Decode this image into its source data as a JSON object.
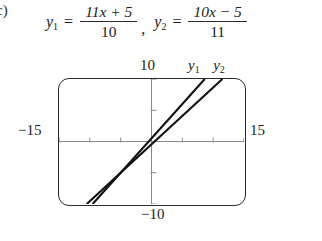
{
  "part": {
    "label": "c)"
  },
  "equations": [
    {
      "name": "y1",
      "lhs_var": "y",
      "lhs_sub": "1",
      "equals": "=",
      "numerator": "11x + 5",
      "denominator": "10",
      "separator": ","
    },
    {
      "name": "y2",
      "lhs_var": "y",
      "lhs_sub": "2",
      "equals": "=",
      "numerator": "10x − 5",
      "denominator": "11",
      "separator": ""
    }
  ],
  "graph": {
    "window_labels": {
      "ymax": "10",
      "ymin": "−10",
      "xmin": "−15",
      "xmax": "15"
    },
    "curve_labels": {
      "first_var": "y",
      "first_sub": "1",
      "second_var": "y",
      "second_sub": "2"
    },
    "colors": {
      "frame": "#2b2b2b",
      "axis": "#8a8a8a",
      "curve": "#111111",
      "background": "#ffffff"
    }
  },
  "chart_data": {
    "type": "line",
    "title": "",
    "xlabel": "",
    "ylabel": "",
    "xlim": [
      -15,
      15
    ],
    "ylim": [
      -10,
      10
    ],
    "grid": false,
    "legend_position": "top",
    "x_tick_spacing": 5,
    "y_tick_spacing": 5,
    "x_ticks": [
      -15,
      -10,
      -5,
      0,
      5,
      10,
      15
    ],
    "y_ticks": [
      -10,
      -5,
      0,
      5,
      10
    ],
    "series": [
      {
        "name": "y1",
        "expression": "(11x + 5)/10",
        "slope": 1.1,
        "intercept": 0.5,
        "x": [
          -9.545,
          8.636
        ],
        "values": [
          -10,
          10
        ]
      },
      {
        "name": "y2",
        "expression": "(10x − 5)/11",
        "slope": 0.909091,
        "intercept": -0.454545,
        "x": [
          -10.5,
          11.5
        ],
        "values": [
          -10,
          10
        ]
      }
    ]
  }
}
